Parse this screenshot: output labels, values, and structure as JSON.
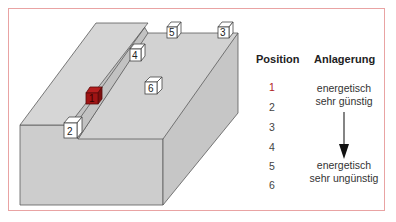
{
  "legend": {
    "position_header": "Position",
    "anlagerung_header": "Anlagerung",
    "positions": [
      "1",
      "2",
      "3",
      "4",
      "5",
      "6"
    ],
    "top_description_line1": "energetisch",
    "top_description_line2": "sehr günstig",
    "bottom_description_line1": "energetisch",
    "bottom_description_line2": "sehr ungünstig",
    "arrow": "down-arrow"
  },
  "cubes": [
    {
      "label": "1",
      "color": "#a01414",
      "state": "highlighted"
    },
    {
      "label": "2",
      "color": "#ffffff"
    },
    {
      "label": "3",
      "color": "#ffffff"
    },
    {
      "label": "4",
      "color": "#ffffff"
    },
    {
      "label": "5",
      "color": "#ffffff"
    },
    {
      "label": "6",
      "color": "#ffffff"
    }
  ],
  "colors": {
    "frame": "#e9a3a3",
    "surface": "#cfcfcf",
    "edge": "#555555",
    "highlight": "#a01414"
  }
}
